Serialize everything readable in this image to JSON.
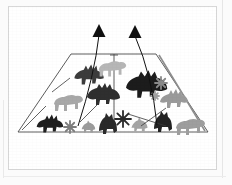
{
  "document": {
    "kind": "scanned-figure",
    "background_color": "#fbfbfb",
    "page_color": "#ffffff",
    "page_border_color": "#d8d8d8",
    "caption": ""
  },
  "figure": {
    "title": "",
    "outline_color": "#4a4a4a",
    "shape": {
      "name": "trapezoid",
      "top_left": [
        63,
        48
      ],
      "top_right": [
        148,
        48
      ],
      "bottom_right": [
        200,
        126
      ],
      "bottom_left": [
        10,
        126
      ]
    },
    "center_divider": {
      "name": "vertical-center-line",
      "x": 106,
      "y_top": 48,
      "y_bottom": 126,
      "cap_label": ""
    },
    "right_fold": {
      "name": "right-fold-line",
      "from": [
        148,
        48
      ],
      "to": [
        200,
        126
      ]
    }
  },
  "arrows": [
    {
      "name": "arrow-left",
      "label": "",
      "tip": [
        91,
        18
      ],
      "tail": [
        70,
        120
      ],
      "color": "#111111"
    },
    {
      "name": "arrow-right",
      "label": "",
      "tip": [
        127,
        19
      ],
      "tail": [
        149,
        119
      ],
      "color": "#111111"
    }
  ],
  "pointer_lines": [
    {
      "name": "pointer-line-upper-left",
      "from": [
        44,
        86
      ],
      "to": [
        62,
        72
      ]
    },
    {
      "name": "pointer-line-lower-left",
      "from": [
        14,
        124
      ],
      "to": [
        38,
        100
      ]
    },
    {
      "name": "pointer-line-mid-left",
      "from": [
        72,
        116
      ],
      "to": [
        90,
        98
      ]
    },
    {
      "name": "pointer-line-mid-right",
      "from": [
        120,
        108
      ],
      "to": [
        158,
        120
      ]
    },
    {
      "name": "pointer-line-lower-right",
      "from": [
        133,
        120
      ],
      "to": [
        158,
        102
      ]
    }
  ],
  "figures": [
    {
      "name": "dino-silhouette",
      "id": "d1",
      "x": 80,
      "y": 68,
      "scale": 1.05,
      "color": "#3c3c3c",
      "variant": "spiked"
    },
    {
      "name": "dino-silhouette",
      "id": "d2",
      "x": 104,
      "y": 62,
      "scale": 0.95,
      "color": "#b6b6b6",
      "variant": "quadruped"
    },
    {
      "name": "dino-silhouette",
      "id": "d3",
      "x": 95,
      "y": 88,
      "scale": 1.0,
      "color": "#2f2f2f",
      "variant": "spotted"
    },
    {
      "name": "dino-silhouette",
      "id": "d4",
      "x": 60,
      "y": 96,
      "scale": 1.0,
      "color": "#a8a8a8",
      "variant": "quadruped"
    },
    {
      "name": "dino-silhouette",
      "id": "d5",
      "x": 41,
      "y": 117,
      "scale": 0.95,
      "color": "#1f1f1f",
      "variant": "spiked"
    },
    {
      "name": "dino-silhouette",
      "id": "d6",
      "x": 80,
      "y": 120,
      "scale": 0.8,
      "color": "#9c9c9c",
      "variant": "small"
    },
    {
      "name": "dino-silhouette",
      "id": "d7",
      "x": 100,
      "y": 119,
      "scale": 1.0,
      "color": "#2a2a2a",
      "variant": "crested"
    },
    {
      "name": "dino-silhouette",
      "id": "d8",
      "x": 138,
      "y": 78,
      "scale": 1.25,
      "color": "#1c1c1c",
      "variant": "spotted"
    },
    {
      "name": "dino-silhouette",
      "id": "d9",
      "x": 165,
      "y": 92,
      "scale": 1.0,
      "color": "#9a9a9a",
      "variant": "spiked"
    },
    {
      "name": "dino-silhouette",
      "id": "d10",
      "x": 131,
      "y": 118,
      "scale": 0.95,
      "color": "#a5a5a5",
      "variant": "small"
    },
    {
      "name": "dino-silhouette",
      "id": "d11",
      "x": 155,
      "y": 117,
      "scale": 1.0,
      "color": "#232323",
      "variant": "crested"
    },
    {
      "name": "dino-silhouette",
      "id": "d12",
      "x": 182,
      "y": 120,
      "scale": 1.0,
      "color": "#9e9e9e",
      "variant": "quadruped"
    }
  ],
  "bursts": [
    {
      "name": "star-burst",
      "id": "s1",
      "x": 62,
      "y": 121,
      "r": 6,
      "color": "#7d7d7d"
    },
    {
      "name": "star-burst",
      "id": "s2",
      "x": 115,
      "y": 113,
      "r": 8,
      "color": "#2b2b2b"
    },
    {
      "name": "star-burst",
      "id": "s3",
      "x": 153,
      "y": 77,
      "r": 6,
      "color": "#8a8a8a"
    },
    {
      "name": "star-burst",
      "id": "s4",
      "x": 147,
      "y": 90,
      "r": 4,
      "color": "#a0a0a0"
    }
  ]
}
